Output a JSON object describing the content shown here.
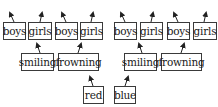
{
  "diagram": {
    "nodes": [
      {
        "id": "boys1",
        "label": "boys",
        "x": 3,
        "y": 22,
        "w": 23,
        "h": 18
      },
      {
        "id": "girls1",
        "label": "girls",
        "x": 28,
        "y": 22,
        "w": 24,
        "h": 18
      },
      {
        "id": "boys2",
        "label": "boys",
        "x": 55,
        "y": 22,
        "w": 23,
        "h": 18
      },
      {
        "id": "girls2",
        "label": "girls",
        "x": 80,
        "y": 22,
        "w": 23,
        "h": 18
      },
      {
        "id": "boys3",
        "label": "boys",
        "x": 114,
        "y": 22,
        "w": 23,
        "h": 18
      },
      {
        "id": "girls3",
        "label": "girls",
        "x": 140,
        "y": 22,
        "w": 23,
        "h": 18
      },
      {
        "id": "boys4",
        "label": "boys",
        "x": 167,
        "y": 22,
        "w": 23,
        "h": 18
      },
      {
        "id": "girls4",
        "label": "girls",
        "x": 193,
        "y": 22,
        "w": 24,
        "h": 18
      },
      {
        "id": "smiling1",
        "label": "smiling",
        "x": 21,
        "y": 53,
        "w": 33,
        "h": 18
      },
      {
        "id": "frowning1",
        "label": "frowning",
        "x": 58,
        "y": 53,
        "w": 41,
        "h": 18
      },
      {
        "id": "smiling2",
        "label": "smiling",
        "x": 124,
        "y": 53,
        "w": 33,
        "h": 18
      },
      {
        "id": "frowning2",
        "label": "frowning",
        "x": 161,
        "y": 53,
        "w": 41,
        "h": 18
      },
      {
        "id": "red",
        "label": "red",
        "x": 83,
        "y": 86,
        "w": 21,
        "h": 18
      },
      {
        "id": "blue",
        "label": "blue",
        "x": 114,
        "y": 86,
        "w": 22,
        "h": 18
      }
    ],
    "arrows": [
      {
        "from": [
          14,
          22
        ],
        "to": [
          10,
          13
        ]
      },
      {
        "from": [
          40,
          22
        ],
        "to": [
          42,
          13
        ]
      },
      {
        "from": [
          66,
          22
        ],
        "to": [
          62,
          13
        ]
      },
      {
        "from": [
          91,
          22
        ],
        "to": [
          93,
          13
        ]
      },
      {
        "from": [
          125,
          22
        ],
        "to": [
          121,
          13
        ]
      },
      {
        "from": [
          151,
          22
        ],
        "to": [
          153,
          13
        ]
      },
      {
        "from": [
          178,
          22
        ],
        "to": [
          174,
          13
        ]
      },
      {
        "from": [
          204,
          22
        ],
        "to": [
          206,
          13
        ]
      },
      {
        "from": [
          40,
          53
        ],
        "to": [
          37,
          44
        ]
      },
      {
        "from": [
          78,
          53
        ],
        "to": [
          81,
          44
        ]
      },
      {
        "from": [
          142,
          53
        ],
        "to": [
          139,
          44
        ]
      },
      {
        "from": [
          181,
          53
        ],
        "to": [
          184,
          44
        ]
      },
      {
        "from": [
          93,
          86
        ],
        "to": [
          90,
          77
        ]
      },
      {
        "from": [
          125,
          86
        ],
        "to": [
          128,
          77
        ]
      }
    ],
    "colors": {
      "stroke": "#3a3a3a",
      "text": "#1a1a1a",
      "background": "#ffffff"
    }
  }
}
